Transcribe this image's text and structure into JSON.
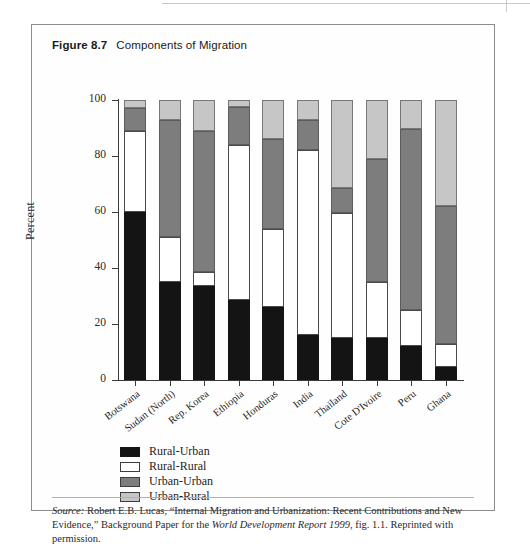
{
  "figure": {
    "number": "Figure 8.7",
    "caption": "Components of Migration"
  },
  "chart_data": {
    "type": "bar",
    "subtype": "stacked-bar-100",
    "title": "Components of Migration",
    "xlabel": "",
    "ylabel": "Percent",
    "ylim": [
      0,
      100
    ],
    "yticks": [
      0,
      20,
      40,
      60,
      80,
      100
    ],
    "ytick_labels": [
      "0",
      "20",
      "40",
      "60",
      "80",
      "100"
    ],
    "grid": false,
    "legend_position": "below-axes-left",
    "categories": [
      "Botswana",
      "Sudan (North)",
      "Rep. Korea",
      "Ethiopia",
      "Honduras",
      "India",
      "Thailand",
      "Cote D'Ivoire",
      "Peru",
      "Ghana"
    ],
    "series": [
      {
        "name": "Rural-Urban",
        "color": "#141414",
        "values": [
          60,
          35,
          33.5,
          28.5,
          26,
          16,
          15,
          15,
          12,
          4.5
        ]
      },
      {
        "name": "Rural-Rural",
        "color": "#ffffff",
        "values": [
          29,
          16,
          5,
          55.5,
          28,
          66,
          44.5,
          20,
          13,
          8.5
        ]
      },
      {
        "name": "Urban-Urban",
        "color": "#7d7d7d",
        "values": [
          8,
          42,
          50.5,
          13.5,
          32,
          11,
          9,
          44,
          64.5,
          49
        ]
      },
      {
        "name": "Urban-Rural",
        "color": "#c6c6c6",
        "values": [
          3,
          7,
          11,
          2.5,
          14,
          7,
          31.5,
          21,
          10.5,
          38
        ]
      }
    ],
    "cumulative_tops": [
      [
        60,
        89,
        97,
        100
      ],
      [
        35,
        51,
        93,
        100
      ],
      [
        33.5,
        38.5,
        89,
        100
      ],
      [
        28.5,
        84,
        97.5,
        100
      ],
      [
        26,
        54,
        86,
        100
      ],
      [
        16,
        82,
        93,
        100
      ],
      [
        15,
        59.5,
        68.5,
        100
      ],
      [
        15,
        35,
        79,
        100
      ],
      [
        12,
        25,
        89.5,
        100
      ],
      [
        4.5,
        13,
        62,
        100
      ]
    ]
  },
  "legend": {
    "items": [
      {
        "label": "Rural-Urban",
        "color": "#141414"
      },
      {
        "label": "Rural-Rural",
        "color": "#ffffff"
      },
      {
        "label": "Urban-Urban",
        "color": "#7d7d7d"
      },
      {
        "label": "Urban-Rural",
        "color": "#c6c6c6"
      }
    ]
  },
  "source": {
    "label": "Source:",
    "line1_rest": " Robert E.B. Lucas, “Internal Migration and Urbanization: Recent Contributions and New Evidence,”",
    "line2_pre": "Background Paper for the ",
    "line2_italic": "World Development Report 1999",
    "line2_post": ", fig. 1.1. Reprinted with permission."
  }
}
